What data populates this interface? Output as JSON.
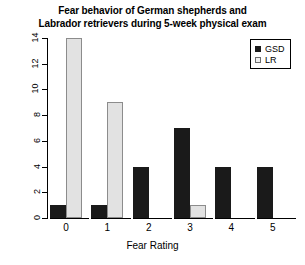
{
  "chart_data": {
    "type": "bar",
    "title": "Fear behavior of German shepherds and Labrador retrievers during 5-week physical exam",
    "title_lines": [
      "Fear behavior of German shepherds and",
      "Labrador retrievers during 5-week physical exam"
    ],
    "xlabel": "Fear Rating",
    "ylabel": "",
    "categories": [
      "0",
      "1",
      "2",
      "3",
      "4",
      "5"
    ],
    "series": [
      {
        "name": "GSD",
        "values": [
          1,
          1,
          4,
          7,
          4,
          4
        ],
        "color": "#1a1a1a"
      },
      {
        "name": "LR",
        "values": [
          14,
          9,
          0,
          1,
          0,
          0
        ],
        "color": "#e2e2e2"
      }
    ],
    "ylim": [
      0,
      14
    ],
    "yticks": [
      0,
      2,
      4,
      6,
      8,
      10,
      12,
      14
    ],
    "ytick_labels": [
      "0",
      "2",
      "4",
      "6",
      "8",
      "10",
      "12",
      "14"
    ],
    "grid": false,
    "legend_position": "top-right",
    "legend_entries": [
      {
        "label": "GSD",
        "swatch": "filled-black-square"
      },
      {
        "label": "LR",
        "swatch": "open-light-square"
      }
    ]
  }
}
